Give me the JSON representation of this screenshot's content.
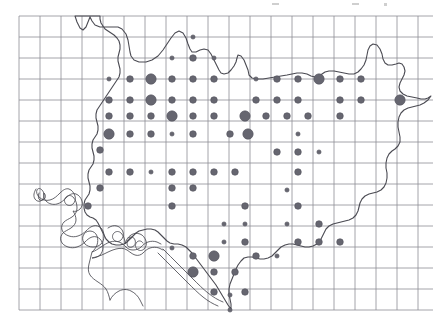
{
  "figure": {
    "background_color": "#ffffff"
  },
  "grid": {
    "name": "reference-grid",
    "line_color": "#8d8d94",
    "line_width": 0.8,
    "cell_size_px": 21,
    "origin_x": 19,
    "origin_y": 16,
    "columns": 20,
    "rows": 14,
    "right_edge": 433,
    "bottom_edge": 310,
    "visible": true
  },
  "boundary": {
    "name": "region-outline",
    "stroke_color": "#4a4a52",
    "stroke_width": 1.1,
    "fill": "none"
  },
  "river": {
    "name": "river-network",
    "stroke_color": "#4a4a52",
    "stroke_width": 0.9,
    "style": "double-bank",
    "fill": "none"
  },
  "symbols": {
    "name": "graduated-dot-symbols",
    "fill_color": "#666670",
    "stroke_color": "#53535c",
    "size_classes": [
      {
        "class": "small",
        "radius_px": 2.1
      },
      {
        "class": "medium",
        "radius_px": 3.3
      },
      {
        "class": "large",
        "radius_px": 5.2
      }
    ],
    "count": 104,
    "points": [
      {
        "x": 193,
        "y": 37,
        "size": "small"
      },
      {
        "x": 193,
        "y": 58,
        "size": "medium"
      },
      {
        "x": 214,
        "y": 58,
        "size": "small"
      },
      {
        "x": 172,
        "y": 58,
        "size": "small"
      },
      {
        "x": 151,
        "y": 79,
        "size": "small"
      },
      {
        "x": 172,
        "y": 79,
        "size": "medium"
      },
      {
        "x": 193,
        "y": 79,
        "size": "medium"
      },
      {
        "x": 214,
        "y": 79,
        "size": "medium"
      },
      {
        "x": 109,
        "y": 79,
        "size": "small"
      },
      {
        "x": 130,
        "y": 79,
        "size": "medium"
      },
      {
        "x": 151,
        "y": 79,
        "size": "large"
      },
      {
        "x": 256,
        "y": 79,
        "size": "small"
      },
      {
        "x": 277,
        "y": 79,
        "size": "medium"
      },
      {
        "x": 298,
        "y": 79,
        "size": "medium"
      },
      {
        "x": 319,
        "y": 79,
        "size": "large"
      },
      {
        "x": 340,
        "y": 79,
        "size": "medium"
      },
      {
        "x": 361,
        "y": 79,
        "size": "medium"
      },
      {
        "x": 109,
        "y": 100,
        "size": "medium"
      },
      {
        "x": 130,
        "y": 100,
        "size": "medium"
      },
      {
        "x": 151,
        "y": 100,
        "size": "large"
      },
      {
        "x": 172,
        "y": 100,
        "size": "medium"
      },
      {
        "x": 193,
        "y": 100,
        "size": "medium"
      },
      {
        "x": 214,
        "y": 100,
        "size": "medium"
      },
      {
        "x": 256,
        "y": 100,
        "size": "medium"
      },
      {
        "x": 277,
        "y": 100,
        "size": "medium"
      },
      {
        "x": 298,
        "y": 100,
        "size": "medium"
      },
      {
        "x": 340,
        "y": 100,
        "size": "medium"
      },
      {
        "x": 361,
        "y": 100,
        "size": "medium"
      },
      {
        "x": 400,
        "y": 100,
        "size": "large"
      },
      {
        "x": 109,
        "y": 116,
        "size": "medium"
      },
      {
        "x": 130,
        "y": 116,
        "size": "medium"
      },
      {
        "x": 151,
        "y": 116,
        "size": "medium"
      },
      {
        "x": 172,
        "y": 116,
        "size": "large"
      },
      {
        "x": 193,
        "y": 116,
        "size": "medium"
      },
      {
        "x": 214,
        "y": 116,
        "size": "medium"
      },
      {
        "x": 245,
        "y": 116,
        "size": "large"
      },
      {
        "x": 266,
        "y": 116,
        "size": "medium"
      },
      {
        "x": 287,
        "y": 116,
        "size": "medium"
      },
      {
        "x": 308,
        "y": 116,
        "size": "medium"
      },
      {
        "x": 340,
        "y": 116,
        "size": "medium"
      },
      {
        "x": 109,
        "y": 134,
        "size": "large"
      },
      {
        "x": 130,
        "y": 134,
        "size": "medium"
      },
      {
        "x": 151,
        "y": 134,
        "size": "medium"
      },
      {
        "x": 172,
        "y": 134,
        "size": "small"
      },
      {
        "x": 193,
        "y": 134,
        "size": "medium"
      },
      {
        "x": 230,
        "y": 134,
        "size": "medium"
      },
      {
        "x": 248,
        "y": 134,
        "size": "large"
      },
      {
        "x": 298,
        "y": 134,
        "size": "small"
      },
      {
        "x": 100,
        "y": 150,
        "size": "medium"
      },
      {
        "x": 277,
        "y": 152,
        "size": "medium"
      },
      {
        "x": 298,
        "y": 152,
        "size": "medium"
      },
      {
        "x": 319,
        "y": 152,
        "size": "small"
      },
      {
        "x": 109,
        "y": 172,
        "size": "medium"
      },
      {
        "x": 130,
        "y": 172,
        "size": "medium"
      },
      {
        "x": 151,
        "y": 172,
        "size": "small"
      },
      {
        "x": 172,
        "y": 172,
        "size": "medium"
      },
      {
        "x": 193,
        "y": 172,
        "size": "medium"
      },
      {
        "x": 214,
        "y": 172,
        "size": "medium"
      },
      {
        "x": 235,
        "y": 172,
        "size": "medium"
      },
      {
        "x": 298,
        "y": 172,
        "size": "medium"
      },
      {
        "x": 100,
        "y": 188,
        "size": "medium"
      },
      {
        "x": 172,
        "y": 188,
        "size": "medium"
      },
      {
        "x": 193,
        "y": 188,
        "size": "medium"
      },
      {
        "x": 88,
        "y": 206,
        "size": "medium"
      },
      {
        "x": 172,
        "y": 206,
        "size": "medium"
      },
      {
        "x": 245,
        "y": 206,
        "size": "medium"
      },
      {
        "x": 298,
        "y": 206,
        "size": "medium"
      },
      {
        "x": 287,
        "y": 190,
        "size": "small"
      },
      {
        "x": 224,
        "y": 224,
        "size": "small"
      },
      {
        "x": 245,
        "y": 224,
        "size": "small"
      },
      {
        "x": 287,
        "y": 224,
        "size": "small"
      },
      {
        "x": 319,
        "y": 224,
        "size": "medium"
      },
      {
        "x": 224,
        "y": 242,
        "size": "small"
      },
      {
        "x": 245,
        "y": 242,
        "size": "medium"
      },
      {
        "x": 298,
        "y": 242,
        "size": "medium"
      },
      {
        "x": 319,
        "y": 242,
        "size": "medium"
      },
      {
        "x": 340,
        "y": 242,
        "size": "medium"
      },
      {
        "x": 193,
        "y": 256,
        "size": "medium"
      },
      {
        "x": 214,
        "y": 256,
        "size": "large"
      },
      {
        "x": 256,
        "y": 256,
        "size": "medium"
      },
      {
        "x": 277,
        "y": 256,
        "size": "small"
      },
      {
        "x": 172,
        "y": 248,
        "size": "small"
      },
      {
        "x": 193,
        "y": 272,
        "size": "large"
      },
      {
        "x": 214,
        "y": 272,
        "size": "medium"
      },
      {
        "x": 235,
        "y": 272,
        "size": "medium"
      },
      {
        "x": 214,
        "y": 292,
        "size": "medium"
      },
      {
        "x": 245,
        "y": 292,
        "size": "medium"
      },
      {
        "x": 230,
        "y": 295,
        "size": "small"
      },
      {
        "x": 230,
        "y": 310,
        "size": "small"
      }
    ]
  },
  "artifacts": {
    "name": "scan-artifacts",
    "marks": [
      {
        "x": 272,
        "y": 3,
        "w": 7,
        "h": 2
      },
      {
        "x": 352,
        "y": 3,
        "w": 7,
        "h": 2
      },
      {
        "x": 384,
        "y": 3,
        "w": 3,
        "h": 3
      }
    ]
  }
}
